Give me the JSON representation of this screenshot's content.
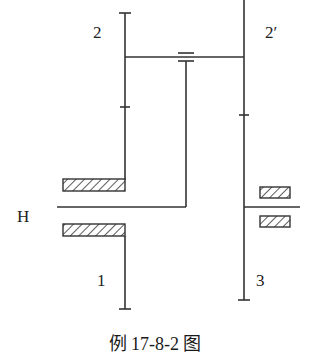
{
  "figure": {
    "caption": "例 17-8-2 图",
    "type": "planetary gear train kinematic sketch"
  },
  "labels": {
    "gear_2": "2",
    "gear_2_prime": "2′",
    "carrier": "H",
    "gear_1": "1",
    "gear_3": "3"
  },
  "colors": {
    "line": "#333333",
    "background": "#ffffff"
  }
}
